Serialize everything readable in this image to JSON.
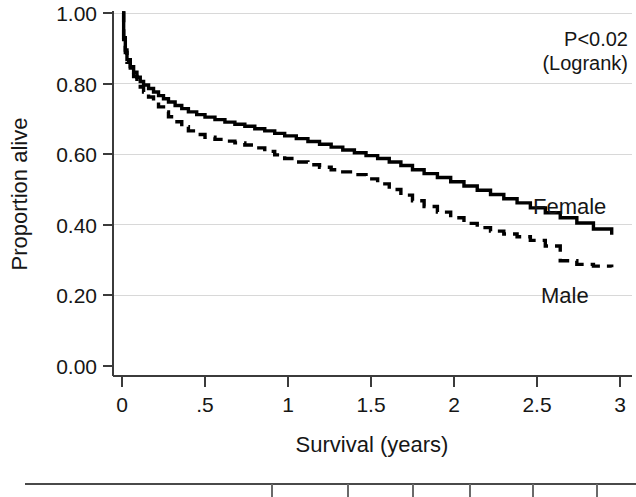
{
  "chart_data": {
    "type": "line",
    "title": "",
    "xlabel": "Survival (years)",
    "ylabel": "Proportion alive",
    "xlim": [
      0,
      3
    ],
    "ylim": [
      0,
      1
    ],
    "grid": true,
    "grid_axis": "y",
    "legend_position": "inline-right",
    "x_ticks": [
      0,
      0.5,
      1,
      1.5,
      2,
      2.5,
      3
    ],
    "x_tick_labels": [
      "0",
      ".5",
      "1",
      "1.5",
      "2",
      "2.5",
      "3"
    ],
    "y_ticks": [
      0.0,
      0.2,
      0.4,
      0.6,
      0.8,
      1.0
    ],
    "y_tick_labels": [
      "0.00",
      "0.20",
      "0.40",
      "0.60",
      "0.80",
      "1.00"
    ],
    "annotations": [
      {
        "name": "pvalue",
        "line1": "P<0.02",
        "line2": "(Logrank)"
      }
    ],
    "series": [
      {
        "name": "Female",
        "style": "solid",
        "label": "Female",
        "color": "#000000",
        "x": [
          0.0,
          0.01,
          0.02,
          0.03,
          0.05,
          0.07,
          0.09,
          0.11,
          0.13,
          0.16,
          0.19,
          0.22,
          0.25,
          0.28,
          0.32,
          0.36,
          0.4,
          0.45,
          0.5,
          0.56,
          0.62,
          0.68,
          0.74,
          0.8,
          0.86,
          0.92,
          0.98,
          1.05,
          1.12,
          1.19,
          1.26,
          1.33,
          1.4,
          1.47,
          1.54,
          1.61,
          1.68,
          1.75,
          1.82,
          1.9,
          1.98,
          2.06,
          2.14,
          2.22,
          2.3,
          2.38,
          2.46,
          2.55,
          2.64,
          2.74,
          2.84,
          2.95
        ],
        "y": [
          1.0,
          0.93,
          0.895,
          0.868,
          0.848,
          0.832,
          0.818,
          0.806,
          0.796,
          0.786,
          0.776,
          0.766,
          0.757,
          0.748,
          0.738,
          0.729,
          0.72,
          0.712,
          0.705,
          0.698,
          0.691,
          0.685,
          0.679,
          0.672,
          0.666,
          0.659,
          0.652,
          0.644,
          0.636,
          0.628,
          0.62,
          0.612,
          0.604,
          0.596,
          0.588,
          0.578,
          0.568,
          0.556,
          0.545,
          0.534,
          0.522,
          0.51,
          0.498,
          0.486,
          0.474,
          0.462,
          0.448,
          0.434,
          0.42,
          0.405,
          0.388,
          0.372
        ],
        "start_value": 1.0,
        "end_value": 0.37
      },
      {
        "name": "Male",
        "style": "dashed",
        "label": "Male",
        "color": "#000000",
        "x": [
          0.0,
          0.01,
          0.02,
          0.03,
          0.05,
          0.07,
          0.09,
          0.11,
          0.13,
          0.16,
          0.19,
          0.22,
          0.25,
          0.28,
          0.32,
          0.36,
          0.4,
          0.45,
          0.5,
          0.56,
          0.62,
          0.68,
          0.74,
          0.8,
          0.86,
          0.92,
          0.98,
          1.05,
          1.12,
          1.19,
          1.26,
          1.33,
          1.4,
          1.47,
          1.54,
          1.61,
          1.68,
          1.75,
          1.82,
          1.9,
          1.98,
          2.06,
          2.14,
          2.22,
          2.3,
          2.38,
          2.46,
          2.55,
          2.64,
          2.74,
          2.84,
          2.95
        ],
        "y": [
          1.0,
          0.925,
          0.888,
          0.86,
          0.838,
          0.82,
          0.804,
          0.79,
          0.776,
          0.762,
          0.748,
          0.734,
          0.72,
          0.706,
          0.692,
          0.678,
          0.666,
          0.656,
          0.648,
          0.642,
          0.637,
          0.632,
          0.626,
          0.618,
          0.608,
          0.598,
          0.588,
          0.578,
          0.57,
          0.563,
          0.556,
          0.55,
          0.542,
          0.53,
          0.516,
          0.5,
          0.484,
          0.468,
          0.452,
          0.436,
          0.42,
          0.404,
          0.392,
          0.382,
          0.374,
          0.366,
          0.356,
          0.34,
          0.298,
          0.288,
          0.283,
          0.28
        ],
        "start_value": 1.0,
        "end_value": 0.28
      }
    ]
  },
  "axes": {
    "y_title": "Proportion alive",
    "x_title": "Survival (years)"
  },
  "labels": {
    "female": "Female",
    "male": "Male",
    "pvalue_line1": "P<0.02",
    "pvalue_line2": "(Logrank)"
  },
  "y_tick_labels": [
    "1.00",
    "0.80",
    "0.60",
    "0.40",
    "0.20",
    "0.00"
  ],
  "x_tick_labels": [
    "0",
    ".5",
    "1",
    "1.5",
    "2",
    "2.5",
    "3"
  ],
  "colors": {
    "curve": "#000000",
    "axis": "#3b3b3b",
    "grid": "#d8d8d8",
    "text": "#161616",
    "background": "#ffffff"
  }
}
